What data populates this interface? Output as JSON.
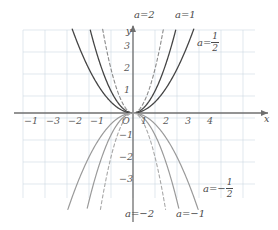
{
  "chart_data": {
    "type": "line",
    "title": "",
    "xlabel": "x",
    "ylabel": "y",
    "function_form": "y = a x^2",
    "xlim": [
      -4.6,
      4.8
    ],
    "ylim": [
      -3.4,
      3.6
    ],
    "grid": true,
    "grid_color": "#cdd9e3",
    "axis_color": "#6f6f6f",
    "origin_label": "O",
    "legend": "inline-labels",
    "x_ticks": [
      {
        "value": -4,
        "label": "−1"
      },
      {
        "value": -3,
        "label": "−3"
      },
      {
        "value": -2,
        "label": "−2"
      },
      {
        "value": -1,
        "label": "−1"
      },
      {
        "value": 1,
        "label": "1"
      },
      {
        "value": 2,
        "label": "2"
      },
      {
        "value": 3,
        "label": "3"
      },
      {
        "value": 4,
        "label": "4"
      }
    ],
    "y_ticks": [
      {
        "value": 3,
        "label": "3"
      },
      {
        "value": 2,
        "label": "2"
      },
      {
        "value": 1,
        "label": "1"
      },
      {
        "value": -1,
        "label": "−1"
      },
      {
        "value": -2,
        "label": "−2"
      },
      {
        "value": -3,
        "label": "−3"
      }
    ],
    "series": [
      {
        "name": "a=2",
        "a": 2,
        "dash": true,
        "color": "#8a8a8a",
        "width": 1.1,
        "label": {
          "prefix": "a=",
          "value": "2",
          "fraction": null
        }
      },
      {
        "name": "a=1",
        "a": 1,
        "dash": false,
        "color": "#454545",
        "width": 1.3,
        "label": {
          "prefix": "a=",
          "value": "1",
          "fraction": null
        }
      },
      {
        "name": "a=1/2",
        "a": 0.5,
        "dash": false,
        "color": "#454545",
        "width": 1.3,
        "label": {
          "prefix": "a=",
          "value": null,
          "fraction": {
            "num": "1",
            "den": "2"
          }
        }
      },
      {
        "name": "a=-1/2",
        "a": -0.5,
        "dash": false,
        "color": "#9a9a9a",
        "width": 1.2,
        "label": {
          "prefix": "a=−",
          "value": null,
          "fraction": {
            "num": "1",
            "den": "2"
          }
        }
      },
      {
        "name": "a=-1",
        "a": -1,
        "dash": false,
        "color": "#9a9a9a",
        "width": 1.2,
        "label": {
          "prefix": "a=",
          "value": "−1",
          "fraction": null
        }
      },
      {
        "name": "a=-2",
        "a": -2,
        "dash": true,
        "color": "#a8a8a8",
        "width": 1.1,
        "label": {
          "prefix": "a=",
          "value": "−2",
          "fraction": null
        }
      }
    ]
  },
  "axes": {
    "x_name": "x",
    "y_name": "y",
    "origin": "O"
  },
  "labels": {
    "a2": "a=2",
    "a1": "a=1",
    "a_half_prefix": "a=",
    "a_half_num": "1",
    "a_half_den": "2",
    "a_neg_half_prefix": "a=−",
    "a_neg_half_num": "1",
    "a_neg_half_den": "2",
    "a_neg1": "a=−1",
    "a_neg2": "a=−2"
  },
  "ticks": {
    "x": [
      "−1",
      "−3",
      "−2",
      "−1",
      "1",
      "2",
      "3",
      "4"
    ],
    "y_pos": [
      "3",
      "2",
      "1"
    ],
    "y_neg": [
      "−1",
      "−2",
      "−3"
    ]
  }
}
